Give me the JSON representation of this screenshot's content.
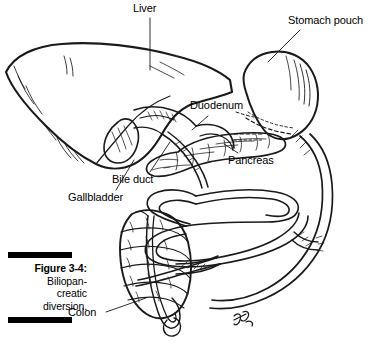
{
  "figure": {
    "caption_label": "Figure 3-4:",
    "caption_body": "Biliopan-creatic diversion.",
    "caption_line_1": "Biliopan-",
    "caption_line_2": "creatic",
    "caption_line_3": "diversion.",
    "rule_color": "#000000",
    "ink_color": "#1a1a1a",
    "background_color": "#ffffff"
  },
  "labels": {
    "liver": "Liver",
    "stomach_pouch": "Stomach pouch",
    "duodenum": "Duodenum",
    "pancreas": "Pancreas",
    "bile_duct": "Bile duct",
    "gallbladder": "Gallbladder",
    "colon": "Colon"
  },
  "diagram": {
    "type": "anatomical-line-drawing",
    "organs": [
      "Liver",
      "Stomach pouch",
      "Duodenum",
      "Pancreas",
      "Bile duct",
      "Gallbladder",
      "Colon",
      "Small intestine"
    ]
  }
}
